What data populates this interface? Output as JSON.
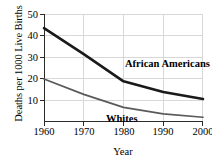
{
  "chart_data": {
    "type": "line",
    "title": "",
    "xlabel": "Year",
    "ylabel": "Deaths per 1000 Live Births",
    "x": [
      1960,
      1970,
      1980,
      1990,
      2000
    ],
    "xlim": [
      1960,
      2000
    ],
    "ylim": [
      4.3,
      50
    ],
    "xticks": [
      "1960",
      "1970",
      "1980",
      "1990",
      "2000"
    ],
    "yticks": [
      "10",
      "20",
      "30",
      "40",
      "50"
    ],
    "ytick_values": [
      10,
      20,
      30,
      40,
      50
    ],
    "grid": true,
    "legend": "inline-labels",
    "series": [
      {
        "name": "African Americans",
        "values": [
          44,
          33,
          21.5,
          17,
          14
        ],
        "color": "#1a1a1a",
        "width": 2.6
      },
      {
        "name": "Whites",
        "values": [
          22.5,
          16,
          10.5,
          7.7,
          6.3
        ],
        "color": "#5a5a5a",
        "width": 1.7
      }
    ],
    "annotations": [
      {
        "text": "African Americans",
        "series": "African Americans"
      },
      {
        "text": "Whites",
        "series": "Whites"
      }
    ]
  },
  "axis": {
    "ylabel": "Deaths per 1000 Live Births",
    "xlabel": "Year",
    "yticks": [
      "50",
      "40",
      "30",
      "20",
      "10"
    ],
    "xticks": [
      "1960",
      "1970",
      "1980",
      "1990",
      "2000"
    ]
  },
  "labels": {
    "african_americans": "African Americans",
    "whites": "Whites"
  },
  "colors": {
    "african_americans": "#1a1a1a",
    "whites": "#5a5a5a",
    "grid": "#d8d8d8",
    "axis": "#2b2b2b",
    "background": "#ffffff"
  }
}
